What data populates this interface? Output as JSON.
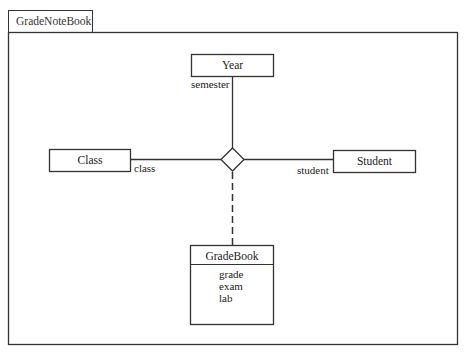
{
  "package": {
    "name": "GradeNoteBook"
  },
  "classes": [
    {
      "id": "year",
      "name": "Year",
      "attributes": []
    },
    {
      "id": "class",
      "name": "Class",
      "attributes": []
    },
    {
      "id": "student",
      "name": "Student",
      "attributes": []
    },
    {
      "id": "gradebook",
      "name": "GradeBook",
      "attributes": [
        "grade",
        "exam",
        "lab"
      ]
    }
  ],
  "association": {
    "type": "n-ary",
    "ends": [
      {
        "class": "Year",
        "role": "semester"
      },
      {
        "class": "Class",
        "role": "class"
      },
      {
        "class": "Student",
        "role": "student"
      }
    ],
    "association_class": "GradeBook"
  },
  "colors": {
    "line": "#333333",
    "background": "#ffffff"
  }
}
